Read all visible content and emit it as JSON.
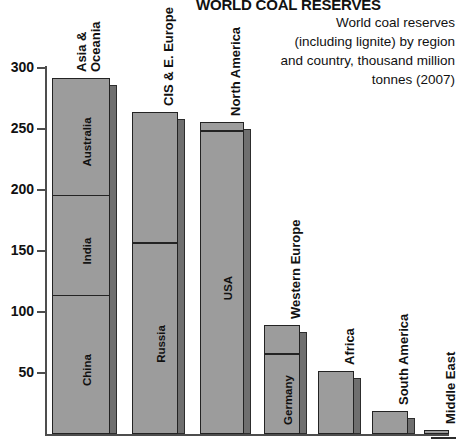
{
  "header": {
    "title": "WORLD COAL RESERVES",
    "description_lines": [
      "World coal reserves",
      "(including lignite) by region",
      "and country, thousand million",
      "tonnes (2007)"
    ]
  },
  "chart_data": {
    "type": "bar",
    "title": "WORLD COAL RESERVES",
    "subtitle": "World coal reserves (including lignite) by region and country, thousand million tonnes (2007)",
    "xlabel": "",
    "ylabel": "",
    "ylim": [
      0,
      300
    ],
    "yticks": [
      50,
      100,
      150,
      200,
      250,
      300
    ],
    "ytick_labels": [
      "50",
      "100",
      "150",
      "200",
      "250",
      "300"
    ],
    "grid": false,
    "legend": "none",
    "units": "thousand million tonnes",
    "categories": [
      "Asia & Oceania",
      "CIS & E. Europe",
      "North America",
      "Western Europe",
      "Africa",
      "South America",
      "Middle East"
    ],
    "values": [
      292,
      264,
      256,
      89,
      52,
      19,
      3
    ],
    "segments": [
      {
        "region": "Asia & Oceania",
        "total": 292,
        "parts": [
          {
            "name": "China",
            "value": 114
          },
          {
            "name": "India",
            "value": 82
          },
          {
            "name": "Australia",
            "value": 96
          }
        ]
      },
      {
        "region": "CIS & E. Europe",
        "total": 264,
        "parts": [
          {
            "name": "Russia",
            "value": 157
          }
        ]
      },
      {
        "region": "North America",
        "total": 256,
        "parts": [
          {
            "name": "USA",
            "value": 249
          }
        ]
      },
      {
        "region": "Western Europe",
        "total": 89,
        "parts": [
          {
            "name": "Germany",
            "value": 66
          }
        ]
      },
      {
        "region": "Africa",
        "total": 52,
        "parts": []
      },
      {
        "region": "South America",
        "total": 19,
        "parts": []
      },
      {
        "region": "Middle East",
        "total": 3,
        "parts": []
      }
    ]
  },
  "axis": {
    "ticks": [
      {
        "label": "300",
        "value": 300
      },
      {
        "label": "250",
        "value": 250
      },
      {
        "label": "200",
        "value": 200
      },
      {
        "label": "150",
        "value": 150
      },
      {
        "label": "100",
        "value": 100
      },
      {
        "label": "50",
        "value": 50
      }
    ]
  },
  "labels": {
    "regions": [
      {
        "text": "Asia &\nOceania",
        "lines": [
          "Asia &",
          "Oceania"
        ]
      },
      {
        "text": "CIS & E. Europe",
        "lines": [
          "CIS & E. Europe"
        ]
      },
      {
        "text": "North America",
        "lines": [
          "North America"
        ]
      },
      {
        "text": "Western Europe",
        "lines": [
          "Western Europe"
        ]
      },
      {
        "text": "Africa",
        "lines": [
          "Africa"
        ]
      },
      {
        "text": "South America",
        "lines": [
          "South America"
        ]
      },
      {
        "text": "Middle East",
        "lines": [
          "Middle East"
        ]
      }
    ],
    "countries": [
      "China",
      "India",
      "Australia",
      "Russia",
      "USA",
      "Germany"
    ]
  },
  "colors": {
    "bar_face": "#9c9c9c",
    "bar_shadow": "#6f6f6f",
    "outline": "#232323",
    "axis": "#4d4d4d",
    "text": "#111111",
    "background": "#ffffff"
  }
}
